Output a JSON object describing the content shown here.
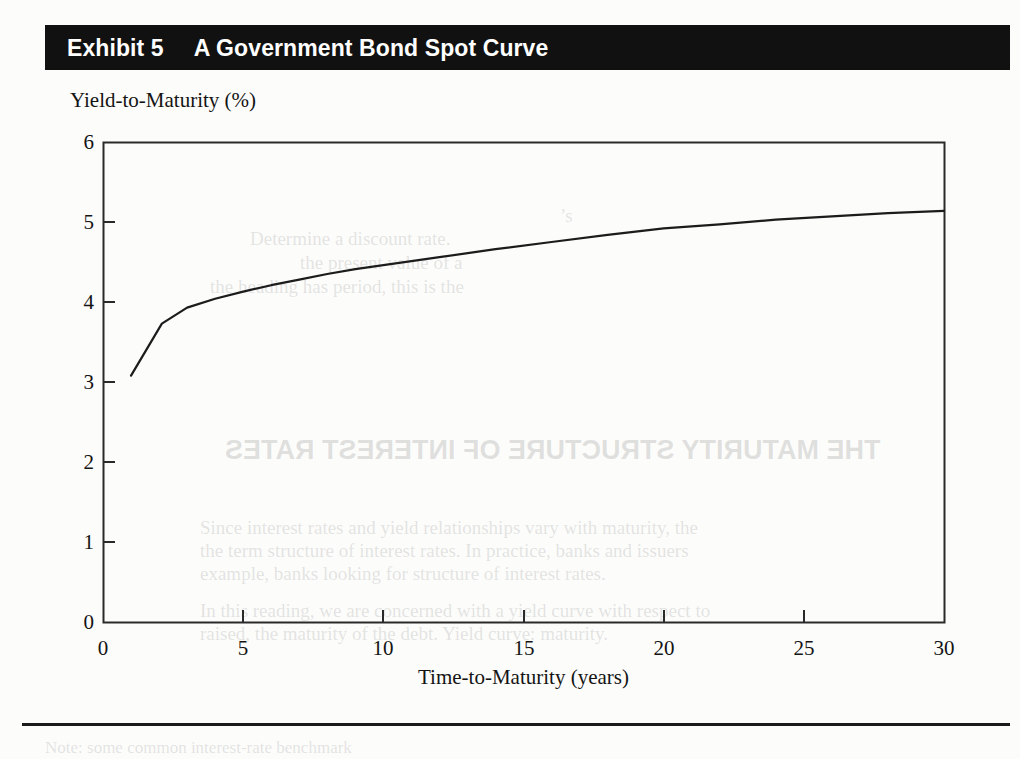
{
  "exhibit": {
    "label": "Exhibit 5",
    "caption": "A Government Bond Spot Curve"
  },
  "chart_data": {
    "type": "line",
    "title": "A Government Bond Spot Curve",
    "xlabel": "Time-to-Maturity (years)",
    "ylabel": "Yield-to-Maturity (%)",
    "xlim": [
      0,
      30
    ],
    "ylim": [
      0,
      6
    ],
    "xticks": [
      0,
      5,
      10,
      15,
      20,
      25,
      30
    ],
    "yticks": [
      0,
      1,
      2,
      3,
      4,
      5,
      6
    ],
    "grid": false,
    "legend": "none",
    "line_color": "#1c1c1c",
    "series": [
      {
        "name": "Government bond spot curve",
        "x": [
          1,
          2.1,
          3,
          4,
          5,
          6,
          7,
          8,
          9,
          10,
          12,
          14,
          16,
          18,
          20,
          22,
          24,
          26,
          28,
          30
        ],
        "y": [
          3.08,
          3.73,
          3.93,
          4.04,
          4.13,
          4.21,
          4.28,
          4.35,
          4.41,
          4.46,
          4.56,
          4.66,
          4.75,
          4.84,
          4.92,
          4.97,
          5.03,
          5.07,
          5.11,
          5.14
        ]
      }
    ]
  },
  "axes": {
    "y_title": "Yield-to-Maturity (%)",
    "x_title": "Time-to-Maturity (years)",
    "y_tick_labels": [
      "6",
      "5",
      "4",
      "3",
      "2",
      "1",
      "0"
    ],
    "x_tick_labels": [
      "0",
      "5",
      "10",
      "15",
      "20",
      "25",
      "30"
    ]
  },
  "ghost_text": {
    "line1": "’s",
    "line2": "Determine a discount rate.",
    "line3": "the present value of a",
    "line4": "the heading has period, this is the",
    "line5": "THE MATURITY STRUCTURE OF INTEREST RATES",
    "line6": "Since interest rates and yield relationships vary with maturity, the",
    "line7": "the term structure of interest rates. In practice, banks and issuers",
    "line8": "example, banks looking for structure of interest rates.",
    "line9": "In this reading, we are concerned with a yield curve with respect to",
    "line10": "raised, the maturity of the debt. Yield curve: maturity.",
    "line11": "Note: some common interest-rate benchmark"
  },
  "colors": {
    "title_bar_bg": "#111111",
    "title_bar_text": "#ffffff",
    "axis": "#2a2a2a",
    "curve": "#1c1c1c",
    "page_bg": "#fcfcfa"
  }
}
